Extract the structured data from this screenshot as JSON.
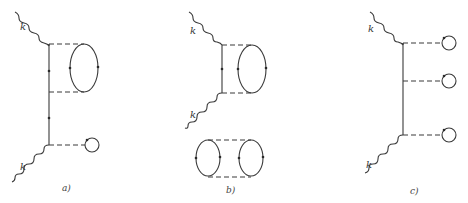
{
  "figure": {
    "panels": [
      {
        "id": "a",
        "caption": "a)",
        "momentum_top": "k",
        "momentum_bottom": "k"
      },
      {
        "id": "b",
        "caption": "b)",
        "momentum_top": "k",
        "momentum_bottom": "k"
      },
      {
        "id": "c",
        "caption": "c)",
        "momentum_top": "k",
        "momentum_bottom": "k"
      }
    ]
  }
}
